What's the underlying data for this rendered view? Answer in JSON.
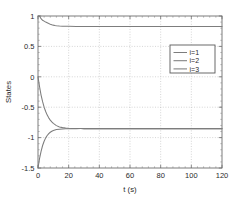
{
  "chart_data": {
    "type": "line",
    "title": "",
    "xlabel": "t (s)",
    "ylabel": "States",
    "xlim": [
      0,
      120
    ],
    "ylim": [
      -1.5,
      1
    ],
    "xticks": [
      0,
      20,
      40,
      60,
      80,
      100,
      120
    ],
    "yticks": [
      1,
      0.5,
      0,
      -0.5,
      -1,
      -1.5
    ],
    "xticklabels": [
      "0",
      "20",
      "40",
      "60",
      "80",
      "100",
      "120"
    ],
    "yticklabels": [
      "1",
      "0.5",
      "0",
      "-0.5",
      "-1",
      "-1.5"
    ],
    "grid": true,
    "legend_position": "upper right",
    "series": [
      {
        "name": "i=1",
        "color": "#7d7d7d",
        "x": [
          0,
          1,
          2,
          3,
          4,
          5,
          6,
          7,
          8,
          9,
          10,
          11,
          12,
          14,
          16,
          18,
          20,
          25,
          30,
          40,
          50,
          60,
          70,
          80,
          90,
          100,
          110,
          120
        ],
        "y": [
          1.0,
          1.0,
          0.955,
          0.93,
          0.915,
          0.9,
          0.888,
          0.876,
          0.866,
          0.857,
          0.85,
          0.844,
          0.84,
          0.835,
          0.832,
          0.831,
          0.83,
          0.829,
          0.829,
          0.828,
          0.828,
          0.828,
          0.828,
          0.828,
          0.828,
          0.828,
          0.828,
          0.828
        ]
      },
      {
        "name": "i=2",
        "color": "#7d7d7d",
        "x": [
          0,
          1,
          2,
          3,
          4,
          5,
          6,
          7,
          8,
          9,
          10,
          12,
          14,
          16,
          18,
          20,
          22,
          25,
          28,
          30,
          35,
          40,
          50,
          60,
          70,
          80,
          90,
          100,
          110,
          120
        ],
        "y": [
          0.0,
          -0.16,
          -0.3,
          -0.41,
          -0.5,
          -0.57,
          -0.63,
          -0.675,
          -0.712,
          -0.742,
          -0.767,
          -0.803,
          -0.824,
          -0.836,
          -0.843,
          -0.847,
          -0.849,
          -0.851,
          -0.852,
          -0.852,
          -0.852,
          -0.852,
          -0.852,
          -0.852,
          -0.852,
          -0.852,
          -0.852,
          -0.852,
          -0.852,
          -0.852
        ]
      },
      {
        "name": "i=3",
        "color": "#7d7d7d",
        "x": [
          0,
          1,
          2,
          3,
          4,
          5,
          6,
          7,
          8,
          9,
          10,
          12,
          14,
          16,
          18,
          20,
          22,
          25,
          28,
          30,
          35,
          40,
          50,
          60,
          70,
          80,
          90,
          100,
          110,
          120
        ],
        "y": [
          -1.5,
          -1.345,
          -1.225,
          -1.13,
          -1.06,
          -1.005,
          -0.965,
          -0.935,
          -0.912,
          -0.895,
          -0.883,
          -0.868,
          -0.861,
          -0.857,
          -0.855,
          -0.854,
          -0.853,
          -0.853,
          -0.852,
          -0.852,
          -0.852,
          -0.852,
          -0.852,
          -0.852,
          -0.852,
          -0.852,
          -0.852,
          -0.852,
          -0.852,
          -0.852
        ]
      }
    ],
    "legend_entries": [
      "i=1",
      "i=2",
      "i=3"
    ]
  }
}
